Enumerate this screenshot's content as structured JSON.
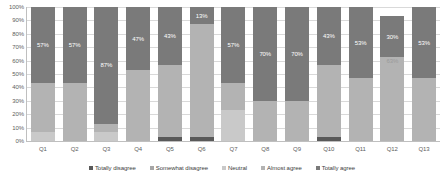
{
  "chart_data": {
    "type": "bar",
    "stacked": true,
    "normalized": "100%",
    "title": "",
    "subtitle": "",
    "xlabel": "",
    "ylabel": "",
    "ylim": [
      0,
      100
    ],
    "grid": true,
    "legend_position": "bottom",
    "categories": [
      "Q1",
      "Q2",
      "Q3",
      "Q4",
      "Q5",
      "Q6",
      "Q7",
      "Q8",
      "Q9",
      "Q10",
      "Q11",
      "Q12",
      "Q13"
    ],
    "ytick_labels": [
      "0%",
      "10%",
      "20%",
      "30%",
      "40%",
      "50%",
      "60%",
      "70%",
      "80%",
      "90%",
      "100%"
    ],
    "ytick_values": [
      0,
      10,
      20,
      30,
      40,
      50,
      60,
      70,
      80,
      90,
      100
    ],
    "series": [
      {
        "name": "Totally disagree",
        "color": "#595959",
        "values": [
          0,
          0,
          0,
          0,
          3,
          3,
          0,
          0,
          0,
          3,
          0,
          0,
          0
        ]
      },
      {
        "name": "Somewhat disagree",
        "color": "#a6a6a6",
        "values": [
          0,
          0,
          0,
          0,
          0,
          0,
          0,
          0,
          0,
          0,
          0,
          0,
          0
        ]
      },
      {
        "name": "Neutral",
        "color": "#c9c9c9",
        "values": [
          7,
          0,
          7,
          0,
          0,
          0,
          23,
          0,
          0,
          0,
          0,
          0,
          0
        ]
      },
      {
        "name": "Almost agree",
        "color": "#b3b3b3",
        "values": [
          36,
          43,
          6,
          53,
          54,
          84,
          20,
          30,
          30,
          54,
          47,
          63,
          47
        ]
      },
      {
        "name": "Totally agree",
        "color": "#7a7a7a",
        "values": [
          57,
          57,
          87,
          47,
          43,
          13,
          57,
          70,
          70,
          43,
          53,
          30,
          53
        ]
      }
    ],
    "data_labels": [
      {
        "category": "Q1",
        "series": "Totally agree",
        "text": "57%"
      },
      {
        "category": "Q2",
        "series": "Totally agree",
        "text": "57%"
      },
      {
        "category": "Q3",
        "series": "Totally agree",
        "text": "87%"
      },
      {
        "category": "Q4",
        "series": "Totally agree",
        "text": "47%"
      },
      {
        "category": "Q5",
        "series": "Totally agree",
        "text": "43%"
      },
      {
        "category": "Q6",
        "series": "Totally agree",
        "text": "13%"
      },
      {
        "category": "Q7",
        "series": "Totally agree",
        "text": "57%"
      },
      {
        "category": "Q8",
        "series": "Totally agree",
        "text": "70%"
      },
      {
        "category": "Q9",
        "series": "Totally agree",
        "text": "70%"
      },
      {
        "category": "Q10",
        "series": "Totally agree",
        "text": "43%"
      },
      {
        "category": "Q11",
        "series": "Totally agree",
        "text": "53%"
      },
      {
        "category": "Q12",
        "series": "Totally agree",
        "text": "30%"
      },
      {
        "category": "Q12",
        "series": "Almost agree",
        "text": "63%"
      },
      {
        "category": "Q13",
        "series": "Totally agree",
        "text": "53%"
      }
    ]
  },
  "legend": {
    "items": [
      {
        "label": "Totally disagree",
        "color": "#595959"
      },
      {
        "label": "Somewhat disagree",
        "color": "#a6a6a6"
      },
      {
        "label": "Neutral",
        "color": "#c9c9c9"
      },
      {
        "label": "Almost agree",
        "color": "#b3b3b3"
      },
      {
        "label": "Totally agree",
        "color": "#7a7a7a"
      }
    ]
  },
  "axis": {
    "y_labels": [
      "100%",
      "90%",
      "80%",
      "70%",
      "60%",
      "50%",
      "40%",
      "30%",
      "20%",
      "10%",
      "0%"
    ],
    "x_labels": [
      "Q1",
      "Q2",
      "Q3",
      "Q4",
      "Q5",
      "Q6",
      "Q7",
      "Q8",
      "Q9",
      "Q10",
      "Q11",
      "Q12",
      "Q13"
    ]
  },
  "colors": {
    "gridline": "#d9d9d9",
    "axis": "#bfbfbf",
    "tick_text": "#606060",
    "legend_text": "#404040",
    "label_text": "#ffffff",
    "background": "#ffffff"
  }
}
